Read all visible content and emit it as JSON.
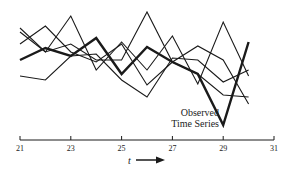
{
  "chart_data": {
    "type": "line",
    "title": "",
    "xlabel": "t",
    "ylabel": "",
    "x": [
      21,
      22,
      23,
      24,
      25,
      26,
      27,
      28,
      29,
      30
    ],
    "xlim": [
      21,
      31
    ],
    "x_ticks": [
      21,
      23,
      25,
      27,
      29,
      31
    ],
    "ylim": [
      0,
      14
    ],
    "grid": false,
    "legend": "none",
    "annotation": {
      "text_line1": "Observed",
      "text_line2": "Time Series",
      "points_to_series": "Observed Time Series",
      "at_x": 29
    },
    "series": [
      {
        "name": "Observed Time Series",
        "emphasis": "thick",
        "values": [
          8.0,
          9.2,
          8.4,
          10.2,
          6.6,
          9.3,
          7.8,
          6.6,
          1.5,
          9.8
        ]
      },
      {
        "name": "Realization 2",
        "emphasis": "thin",
        "values": [
          10.8,
          8.8,
          9.6,
          8.0,
          8.0,
          12.8,
          7.8,
          6.6,
          4.5,
          4.3
        ]
      },
      {
        "name": "Realization 3",
        "emphasis": "thin",
        "values": [
          9.6,
          11.4,
          8.8,
          7.8,
          9.6,
          5.5,
          7.8,
          9.4,
          8.0,
          3.6
        ]
      },
      {
        "name": "Realization 4",
        "emphasis": "thin",
        "values": [
          11.2,
          8.8,
          12.4,
          7.0,
          9.8,
          7.0,
          10.4,
          5.6,
          11.8,
          6.4
        ]
      },
      {
        "name": "Realization 5",
        "emphasis": "thin",
        "values": [
          6.4,
          6.0,
          8.4,
          8.6,
          6.0,
          4.3,
          8.2,
          8.0,
          5.8,
          7.0
        ]
      }
    ]
  },
  "axis": {
    "tick_labels": [
      "21",
      "23",
      "25",
      "27",
      "29",
      "31"
    ],
    "x_label": "t",
    "arrow": "right-arrow"
  },
  "annotation": {
    "line1": "Observed",
    "line2": "Time Series"
  },
  "colors": {
    "ink": "#1a1a1a",
    "background": "#ffffff"
  }
}
